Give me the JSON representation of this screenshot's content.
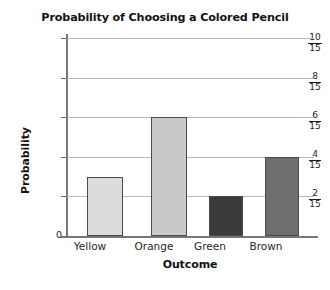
{
  "chart_data": {
    "type": "bar",
    "title": "Probability of Choosing a Colored Pencil",
    "xlabel": "Outcome",
    "ylabel": "Probability",
    "categories": [
      "Yellow",
      "Orange",
      "Green",
      "Brown"
    ],
    "values": [
      0.2,
      0.4,
      0.13333,
      0.26667
    ],
    "value_labels": [
      "3/15",
      "6/15",
      "2/15",
      "4/15"
    ],
    "ylim": [
      0,
      0.66667
    ],
    "grid": true,
    "legend": "none",
    "yticks": [
      {
        "value": 0,
        "label": "0",
        "numerator": "0",
        "denominator": ""
      },
      {
        "value": 0.13333,
        "label": "2/15",
        "numerator": "2",
        "denominator": "15"
      },
      {
        "value": 0.26667,
        "label": "4/15",
        "numerator": "4",
        "denominator": "15"
      },
      {
        "value": 0.4,
        "label": "6/15",
        "numerator": "6",
        "denominator": "15"
      },
      {
        "value": 0.53333,
        "label": "8/15",
        "numerator": "8",
        "denominator": "15"
      },
      {
        "value": 0.66667,
        "label": "10/15",
        "numerator": "10",
        "denominator": "15"
      }
    ],
    "series": [
      {
        "name": "Probability",
        "points": [
          {
            "category": "Yellow",
            "value": 0.2,
            "label": "3/15",
            "color": "#dcdcdc"
          },
          {
            "category": "Orange",
            "value": 0.4,
            "label": "6/15",
            "color": "#c9c9c9"
          },
          {
            "category": "Green",
            "value": 0.13333,
            "label": "2/15",
            "color": "#3a3a3a"
          },
          {
            "category": "Brown",
            "value": 0.26667,
            "label": "4/15",
            "color": "#6e6e6e"
          }
        ]
      }
    ],
    "colors": {
      "yellow_bar": "#dcdcdc",
      "orange_bar": "#c9c9c9",
      "green_bar": "#3a3a3a",
      "brown_bar": "#6e6e6e",
      "bar_outline": "#4a4a4a",
      "gridline": "#b9b9b9",
      "axis": "#767676",
      "text": "#121212",
      "background": "#ffffff"
    }
  }
}
